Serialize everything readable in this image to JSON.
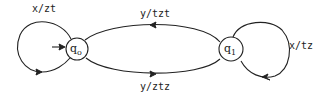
{
  "diagram": {
    "type": "finite-state-transducer",
    "states": [
      {
        "id": "q0",
        "label": "q",
        "subscript": "o",
        "initial": true
      },
      {
        "id": "q1",
        "label": "q",
        "subscript": "1",
        "initial": false
      }
    ],
    "transitions": [
      {
        "from": "q0",
        "to": "q0",
        "label": "x/zt"
      },
      {
        "from": "q1",
        "to": "q0",
        "label": "y/tzt"
      },
      {
        "from": "q0",
        "to": "q1",
        "label": "y/ztz"
      },
      {
        "from": "q1",
        "to": "q1",
        "label": "x/tz"
      }
    ]
  }
}
